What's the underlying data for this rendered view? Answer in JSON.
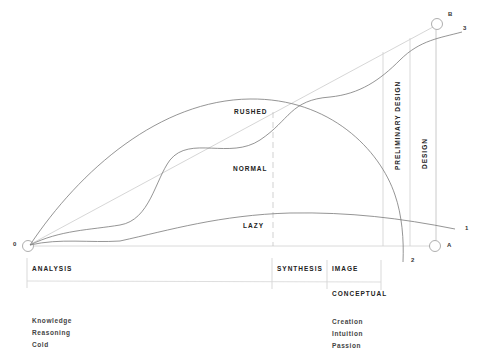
{
  "diagram": {
    "type": "process-curves",
    "points": {
      "origin": {
        "label": "0"
      },
      "a": {
        "label": "A"
      },
      "b": {
        "label": "B"
      }
    },
    "curves": [
      {
        "id": "rushed",
        "label": "RUSHED",
        "end_label": "2"
      },
      {
        "id": "normal",
        "label": "NORMAL",
        "end_label": "3"
      },
      {
        "id": "lazy",
        "label": "LAZY",
        "end_label": "1"
      }
    ],
    "vertical_labels": {
      "preliminary_design": "PRELIMINARY DESIGN",
      "design": "DESIGN"
    },
    "phases": {
      "analysis": "ANALYSIS",
      "synthesis": "SYNTHESIS",
      "image": "IMAGE",
      "conceptual": "CONCEPTUAL"
    },
    "left_column": [
      "Knowledge",
      "Reasoning",
      "Cold"
    ],
    "right_column": [
      "Creation",
      "Intuition",
      "Passion"
    ],
    "colors": {
      "curve": "#777777",
      "straight_line": "#c8c8c8",
      "guides": "#cfcfcf",
      "text": "#222222"
    }
  }
}
